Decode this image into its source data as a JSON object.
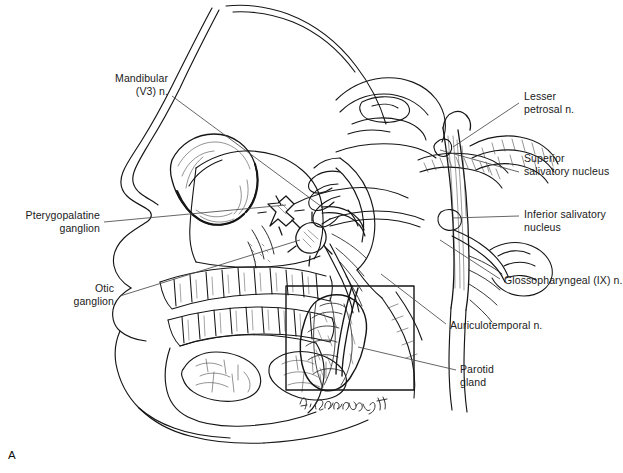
{
  "figure": {
    "panel_letter": "A",
    "signature": "A. Cummings '94",
    "background_color": "#ffffff",
    "ink_color": "#151515",
    "leader_color": "#4a4a4a"
  },
  "labels": [
    {
      "id": "mandibular",
      "name": "label-mandibular-nerve",
      "text": "Mandibular\n(V3) n.",
      "align": "right",
      "x": 68,
      "y": 72,
      "width": 100,
      "leader": [
        [
          172,
          96
        ],
        [
          322,
          207
        ]
      ]
    },
    {
      "id": "pterygopalatine",
      "name": "label-pterygopalatine-ganglion",
      "text": "Pterygopalatine\nganglion",
      "align": "right",
      "x": 6,
      "y": 209,
      "width": 94,
      "leader": [
        [
          104,
          222
        ],
        [
          286,
          205
        ]
      ]
    },
    {
      "id": "otic",
      "name": "label-otic-ganglion",
      "text": "Otic\nganglion",
      "align": "right",
      "x": 56,
      "y": 282,
      "width": 58,
      "leader": [
        [
          120,
          296
        ],
        [
          300,
          240
        ]
      ]
    },
    {
      "id": "lesser-petrosal",
      "name": "label-lesser-petrosal-nerve",
      "text": "Lesser\npetrosal n.",
      "align": "left",
      "x": 524,
      "y": 90,
      "width": 95,
      "leader": [
        [
          519,
          103
        ],
        [
          453,
          147
        ]
      ]
    },
    {
      "id": "superior-salivatory",
      "name": "label-superior-salivatory-nucleus",
      "text": "Superior\nsalivatory nucleus",
      "align": "left",
      "x": 524,
      "y": 152,
      "width": 99,
      "leader": [
        [
          519,
          172
        ],
        [
          440,
          150
        ]
      ]
    },
    {
      "id": "inferior-salivatory",
      "name": "label-inferior-salivatory-nucleus",
      "text": "Inferior salivatory\nnucleus",
      "align": "left",
      "x": 524,
      "y": 208,
      "width": 99,
      "leader": [
        [
          519,
          216
        ],
        [
          452,
          218
        ]
      ]
    },
    {
      "id": "glossopharyngeal",
      "name": "label-glossopharyngeal-nerve",
      "text": "Glossopharyngeal (IX) n.",
      "align": "left",
      "x": 504,
      "y": 274,
      "width": 119,
      "leader": [
        [
          500,
          279
        ],
        [
          440,
          240
        ]
      ]
    },
    {
      "id": "auriculotemporal",
      "name": "label-auriculotemporal-nerve",
      "text": "Auriculotemporal n.",
      "align": "left",
      "x": 450,
      "y": 319,
      "width": 110,
      "leader": [
        [
          446,
          324
        ],
        [
          381,
          274
        ]
      ]
    },
    {
      "id": "parotid",
      "name": "label-parotid-gland",
      "text": "Parotid\ngland",
      "align": "left",
      "x": 460,
      "y": 363,
      "width": 60,
      "leader": [
        [
          456,
          370
        ],
        [
          358,
          347
        ]
      ]
    }
  ],
  "anatomy": {
    "title": "Parasympathetic innervation of the parotid gland",
    "structures": [
      "facial profile",
      "orbit",
      "maxilla",
      "mandible",
      "upper teeth row",
      "lower teeth row",
      "sublingual gland",
      "submandibular gland",
      "nasal cavity",
      "tongue",
      "soft palate",
      "brainstem",
      "cerebellum",
      "cervical spinal cord",
      "pterygopalatine ganglion",
      "otic ganglion",
      "lesser petrosal nerve",
      "auriculotemporal nerve",
      "glossopharyngeal nerve",
      "parotid gland inset"
    ]
  }
}
